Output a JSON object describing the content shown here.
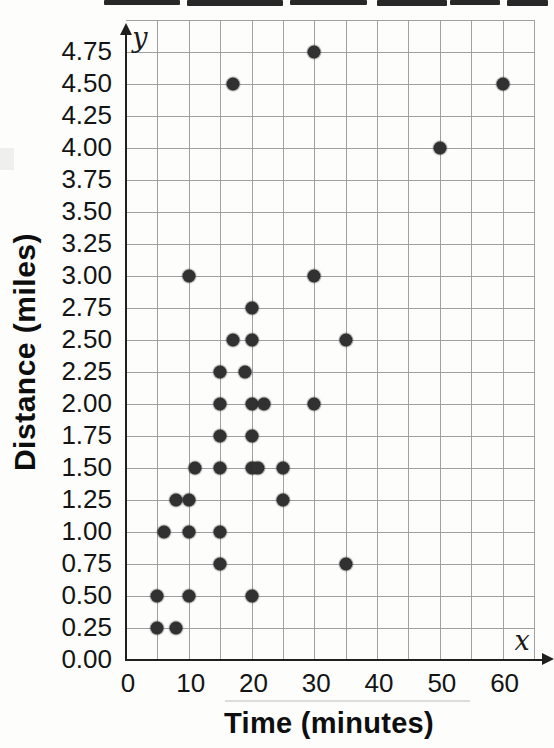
{
  "chart_data": {
    "type": "scatter",
    "xlabel": "Time (minutes)",
    "ylabel": "Distance (miles)",
    "x_axis_letter": "x",
    "y_axis_letter": "y",
    "x_grid": {
      "min": 0,
      "max": 65,
      "step": 5
    },
    "y_grid": {
      "min": 0,
      "max": 5,
      "step": 0.25
    },
    "x_ticks": [
      {
        "label": "0",
        "value": 0
      },
      {
        "label": "10",
        "value": 10
      },
      {
        "label": "20",
        "value": 20
      },
      {
        "label": "30",
        "value": 30
      },
      {
        "label": "40",
        "value": 40
      },
      {
        "label": "50",
        "value": 50
      },
      {
        "label": "60",
        "value": 60
      }
    ],
    "y_ticks": [
      {
        "label": "0.00",
        "value": 0.0
      },
      {
        "label": "0.25",
        "value": 0.25
      },
      {
        "label": "0.50",
        "value": 0.5
      },
      {
        "label": "0.75",
        "value": 0.75
      },
      {
        "label": "1.00",
        "value": 1.0
      },
      {
        "label": "1.25",
        "value": 1.25
      },
      {
        "label": "1.50",
        "value": 1.5
      },
      {
        "label": "1.75",
        "value": 1.75
      },
      {
        "label": "2.00",
        "value": 2.0
      },
      {
        "label": "2.25",
        "value": 2.25
      },
      {
        "label": "2.50",
        "value": 2.5
      },
      {
        "label": "2.75",
        "value": 2.75
      },
      {
        "label": "3.00",
        "value": 3.0
      },
      {
        "label": "3.25",
        "value": 3.25
      },
      {
        "label": "3.50",
        "value": 3.5
      },
      {
        "label": "3.75",
        "value": 3.75
      },
      {
        "label": "4.00",
        "value": 4.0
      },
      {
        "label": "4.25",
        "value": 4.25
      },
      {
        "label": "4.50",
        "value": 4.5
      },
      {
        "label": "4.75",
        "value": 4.75
      }
    ],
    "points": [
      {
        "x": 5,
        "y": 0.25
      },
      {
        "x": 8,
        "y": 0.25
      },
      {
        "x": 5,
        "y": 0.5
      },
      {
        "x": 10,
        "y": 0.5
      },
      {
        "x": 20,
        "y": 0.5
      },
      {
        "x": 15,
        "y": 0.75
      },
      {
        "x": 35,
        "y": 0.75
      },
      {
        "x": 6,
        "y": 1.0
      },
      {
        "x": 10,
        "y": 1.0
      },
      {
        "x": 15,
        "y": 1.0
      },
      {
        "x": 8,
        "y": 1.25
      },
      {
        "x": 10,
        "y": 1.25
      },
      {
        "x": 25,
        "y": 1.25
      },
      {
        "x": 11,
        "y": 1.5
      },
      {
        "x": 15,
        "y": 1.5
      },
      {
        "x": 20,
        "y": 1.5
      },
      {
        "x": 21,
        "y": 1.5
      },
      {
        "x": 25,
        "y": 1.5
      },
      {
        "x": 15,
        "y": 1.75
      },
      {
        "x": 20,
        "y": 1.75
      },
      {
        "x": 15,
        "y": 2.0
      },
      {
        "x": 20,
        "y": 2.0
      },
      {
        "x": 22,
        "y": 2.0
      },
      {
        "x": 30,
        "y": 2.0
      },
      {
        "x": 15,
        "y": 2.25
      },
      {
        "x": 19,
        "y": 2.25
      },
      {
        "x": 17,
        "y": 2.5
      },
      {
        "x": 20,
        "y": 2.5
      },
      {
        "x": 35,
        "y": 2.5
      },
      {
        "x": 20,
        "y": 2.75
      },
      {
        "x": 10,
        "y": 3.0
      },
      {
        "x": 30,
        "y": 3.0
      },
      {
        "x": 50,
        "y": 4.0
      },
      {
        "x": 17,
        "y": 4.5
      },
      {
        "x": 60,
        "y": 4.5
      },
      {
        "x": 30,
        "y": 4.75
      }
    ],
    "colors": {
      "point": "#313131",
      "grid": "#a0a0a0",
      "axis": "#1f1f1f",
      "text": "#121212"
    },
    "legend": "none",
    "grid_on": true
  }
}
